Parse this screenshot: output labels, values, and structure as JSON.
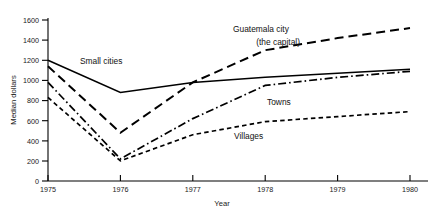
{
  "chart_data": {
    "type": "line",
    "title": "",
    "xlabel": "Year",
    "ylabel": "Median dollars",
    "x": [
      1975,
      1976,
      1977,
      1978,
      1979,
      1980
    ],
    "xticklabels": [
      "1975",
      "1976",
      "1977",
      "1978",
      "1979",
      "1980"
    ],
    "xlim": [
      1975,
      1980
    ],
    "ylim": [
      0,
      1600
    ],
    "yticks": [
      0,
      200,
      400,
      600,
      800,
      1000,
      1200,
      1400,
      1600
    ],
    "yticklabels": [
      "0",
      "200",
      "400",
      "600",
      "800",
      "1000",
      "1200",
      "1400",
      "1600"
    ],
    "grid": false,
    "legend": "inline-annotations",
    "series": [
      {
        "name": "Small cities",
        "label": "Small cities",
        "linestyle": "solid",
        "color": "#000000",
        "values": [
          1200,
          880,
          980,
          1030,
          1070,
          1110
        ]
      },
      {
        "name": "Guatemala city (the capital)",
        "label": "Guatemala city",
        "label_line2": "(the capital)",
        "linestyle": "long-dash",
        "color": "#000000",
        "values": [
          1140,
          480,
          980,
          1300,
          1420,
          1520
        ]
      },
      {
        "name": "Towns",
        "label": "Towns",
        "linestyle": "dash-dot",
        "color": "#000000",
        "values": [
          980,
          220,
          620,
          950,
          1030,
          1090
        ]
      },
      {
        "name": "Villages",
        "label": "Villages",
        "linestyle": "short-dash",
        "color": "#000000",
        "values": [
          830,
          200,
          460,
          590,
          640,
          690
        ]
      }
    ],
    "annotations": [
      {
        "text": "Small cities",
        "series": "Small cities"
      },
      {
        "text": "Guatemala city",
        "series": "Guatemala city (the capital)"
      },
      {
        "text": "(the capital)",
        "series": "Guatemala city (the capital)"
      },
      {
        "text": "Towns",
        "series": "Towns"
      },
      {
        "text": "Villages",
        "series": "Villages"
      }
    ]
  },
  "axes": {
    "y_title": "Median dollars",
    "x_title": "Year"
  }
}
